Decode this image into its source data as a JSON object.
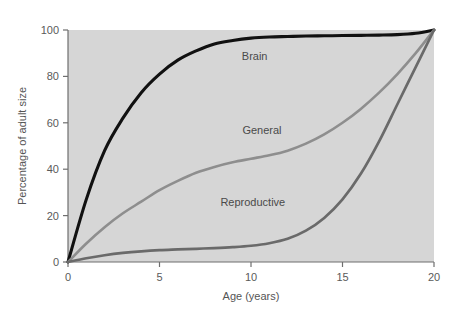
{
  "chart_data": {
    "type": "line",
    "title": "",
    "xlabel": "Age (years)",
    "ylabel": "Percentage of adult size",
    "xlim": [
      0,
      20
    ],
    "ylim": [
      0,
      100
    ],
    "xticks": [
      0,
      5,
      10,
      15,
      20
    ],
    "yticks": [
      0,
      20,
      40,
      60,
      80,
      100
    ],
    "xtick_labels": [
      "0",
      "5",
      "10",
      "15",
      "20"
    ],
    "ytick_labels": [
      "0",
      "20",
      "40",
      "60",
      "80",
      "100"
    ],
    "grid": false,
    "legend_position": "inline-annotations",
    "plot_background": "#d6d6d6",
    "page_background": "#ffffff",
    "x": [
      0,
      1,
      2,
      3,
      4,
      5,
      6,
      7,
      8,
      9,
      10,
      11,
      12,
      13,
      14,
      15,
      16,
      17,
      18,
      19,
      20
    ],
    "series": [
      {
        "name": "Brain",
        "color": "#111111",
        "width": 3.1,
        "values": [
          0,
          27,
          48,
          62,
          73,
          81,
          87,
          91,
          94,
          95.5,
          96.5,
          97,
          97.2,
          97.4,
          97.5,
          97.6,
          97.7,
          97.8,
          98,
          98.6,
          100
        ],
        "label_x": 10.2,
        "label_y": 87
      },
      {
        "name": "General",
        "color": "#8e8e8e",
        "width": 2.6,
        "values": [
          0,
          8,
          15,
          21,
          26,
          31,
          35,
          38.5,
          41,
          43,
          44.5,
          46,
          48,
          51,
          55,
          60,
          66,
          73,
          81,
          90,
          100
        ],
        "label_x": 10.6,
        "label_y": 55
      },
      {
        "name": "Reproductive",
        "color": "#6a6a6a",
        "width": 2.7,
        "values": [
          0,
          1.6,
          2.9,
          3.9,
          4.6,
          5.1,
          5.4,
          5.7,
          6,
          6.4,
          7,
          8.1,
          10,
          13.5,
          19,
          27,
          38,
          52,
          68,
          84,
          100
        ],
        "label_x": 10.1,
        "label_y": 24
      }
    ]
  },
  "axes": {
    "x_axis_title": "Age (years)",
    "y_axis_title": "Percentage of adult size"
  }
}
